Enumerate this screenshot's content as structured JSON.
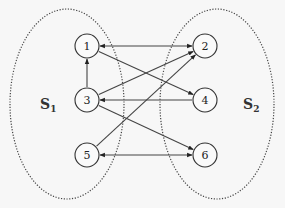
{
  "diagram": {
    "sets": [
      {
        "id": "S1",
        "label": "S",
        "subscript": "1",
        "cx": 67,
        "cy": 104,
        "rx": 57,
        "ry": 95,
        "label_x": 40,
        "label_y": 104
      },
      {
        "id": "S2",
        "label": "S",
        "subscript": "2",
        "cx": 217,
        "cy": 104,
        "rx": 57,
        "ry": 95,
        "label_x": 243,
        "label_y": 104
      }
    ],
    "nodes": [
      {
        "id": "1",
        "label": "1",
        "x": 87,
        "y": 46
      },
      {
        "id": "2",
        "label": "2",
        "x": 205,
        "y": 46
      },
      {
        "id": "3",
        "label": "3",
        "x": 87,
        "y": 100
      },
      {
        "id": "4",
        "label": "4",
        "x": 205,
        "y": 100
      },
      {
        "id": "5",
        "label": "5",
        "x": 87,
        "y": 155
      },
      {
        "id": "6",
        "label": "6",
        "x": 205,
        "y": 155
      }
    ],
    "node_radius": 12,
    "edges": [
      {
        "from": "1",
        "to": "2",
        "bidirectional": true
      },
      {
        "from": "1",
        "to": "4",
        "bidirectional": false
      },
      {
        "from": "3",
        "to": "1",
        "bidirectional": false
      },
      {
        "from": "3",
        "to": "2",
        "bidirectional": false
      },
      {
        "from": "4",
        "to": "3",
        "bidirectional": false
      },
      {
        "from": "3",
        "to": "6",
        "bidirectional": false
      },
      {
        "from": "5",
        "to": "2",
        "bidirectional": false
      },
      {
        "from": "5",
        "to": "6",
        "bidirectional": true
      }
    ]
  }
}
